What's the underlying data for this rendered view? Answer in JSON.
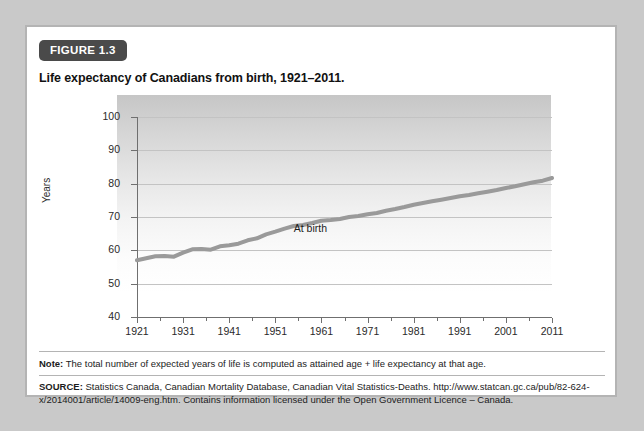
{
  "figure": {
    "badge": "FIGURE 1.3",
    "title": "Life expectancy of Canadians from birth, 1921–2011."
  },
  "notes": {
    "note_label": "Note:",
    "note_text": " The total number of expected years of life is computed as attained age + life expectancy at that age.",
    "source_label": "SOURCE:",
    "source_text": " Statistics Canada, Canadian Mortality Database, Canadian Vital Statistics-Deaths. http://www.statcan.gc.ca/pub/82-624-x/2014001/article/14009-eng.htm. Contains information licensed under the Open Government Licence – Canada."
  },
  "colors": {
    "badge_bg": "#4a4a4a",
    "line": "#9a9a9a",
    "gridline": "#c3c3c3",
    "axis": "#6f6f6f",
    "card_border": "#b4b4b4",
    "page_bg": "#c9c9c9"
  },
  "chart_data": {
    "type": "line",
    "title": "Life expectancy of Canadians from birth, 1921–2011.",
    "xlabel": "",
    "ylabel": "Years",
    "xlim": [
      1921,
      2011
    ],
    "ylim": [
      40,
      100
    ],
    "yticks": [
      40,
      50,
      60,
      70,
      80,
      90,
      100
    ],
    "xticks": [
      1921,
      1931,
      1941,
      1951,
      1961,
      1971,
      1981,
      1991,
      2001,
      2011
    ],
    "x_minor_interval": 5,
    "grid": true,
    "grid_axis": "y",
    "legend": "none",
    "annotations": [
      {
        "text": "At birth",
        "x": 1955,
        "y": 66.5
      }
    ],
    "series": [
      {
        "name": "At birth",
        "color": "#9a9a9a",
        "x": [
          1921,
          1923,
          1925,
          1927,
          1929,
          1931,
          1933,
          1935,
          1937,
          1939,
          1941,
          1943,
          1945,
          1947,
          1949,
          1951,
          1953,
          1955,
          1957,
          1959,
          1961,
          1963,
          1965,
          1967,
          1969,
          1971,
          1973,
          1975,
          1977,
          1979,
          1981,
          1983,
          1985,
          1987,
          1989,
          1991,
          1993,
          1995,
          1997,
          1999,
          2001,
          2003,
          2005,
          2007,
          2009,
          2011
        ],
        "values": [
          57.0,
          57.6,
          58.2,
          58.3,
          58.1,
          59.3,
          60.3,
          60.4,
          60.2,
          61.2,
          61.5,
          62.0,
          63.0,
          63.6,
          64.8,
          65.6,
          66.5,
          67.3,
          67.6,
          68.2,
          68.9,
          69.1,
          69.4,
          70.0,
          70.3,
          70.8,
          71.2,
          71.9,
          72.4,
          73.0,
          73.7,
          74.2,
          74.7,
          75.2,
          75.7,
          76.2,
          76.6,
          77.1,
          77.6,
          78.1,
          78.7,
          79.2,
          79.8,
          80.4,
          80.9,
          81.7
        ]
      }
    ]
  }
}
